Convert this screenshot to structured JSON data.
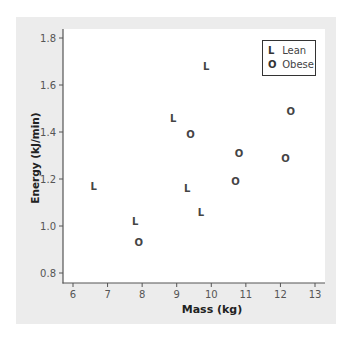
{
  "chart_data": {
    "type": "scatter",
    "title": "",
    "xlabel": "Mass (kg)",
    "ylabel": "Energy (kJ/min)",
    "xlim": [
      5.7,
      13.3
    ],
    "ylim": [
      0.76,
      1.84
    ],
    "xticks": [
      6,
      7,
      8,
      9,
      10,
      11,
      12,
      13
    ],
    "yticks": [
      0.8,
      1.0,
      1.2,
      1.4,
      1.6,
      1.8
    ],
    "ytick_labels": [
      "0.8",
      "1.0",
      "1.2",
      "1.4",
      "1.6",
      "1.8"
    ],
    "grid": false,
    "legend_position": "top-right",
    "series": [
      {
        "name": "Lean",
        "marker": "L",
        "points": [
          {
            "x": 9.85,
            "y": 1.68
          },
          {
            "x": 8.9,
            "y": 1.46
          },
          {
            "x": 6.6,
            "y": 1.17
          },
          {
            "x": 9.3,
            "y": 1.16
          },
          {
            "x": 9.7,
            "y": 1.06
          },
          {
            "x": 7.8,
            "y": 1.02
          }
        ]
      },
      {
        "name": "Obese",
        "marker": "O",
        "points": [
          {
            "x": 9.4,
            "y": 1.39
          },
          {
            "x": 12.3,
            "y": 1.49
          },
          {
            "x": 10.8,
            "y": 1.31
          },
          {
            "x": 12.15,
            "y": 1.29
          },
          {
            "x": 10.7,
            "y": 1.19
          },
          {
            "x": 7.9,
            "y": 0.93
          }
        ]
      }
    ]
  },
  "legend": {
    "items": [
      {
        "marker": "L",
        "label": "Lean"
      },
      {
        "marker": "O",
        "label": "Obese"
      }
    ]
  },
  "axes": {
    "xlabel": "Mass (kg)",
    "ylabel": "Energy (kJ/min)"
  },
  "colors": {
    "panel": "#ececec",
    "plot": "#ffffff",
    "axis": "#555555",
    "marker": "#444444"
  }
}
